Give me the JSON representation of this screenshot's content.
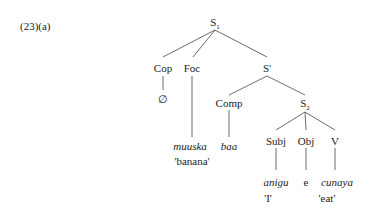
{
  "example_number": "(23)(a)",
  "tree": {
    "root": {
      "label": "S",
      "subscript": "1"
    },
    "cop": "Cop",
    "foc": "Foc",
    "sbar": "S'",
    "null_cop": "∅",
    "comp": "Comp",
    "s2": {
      "label": "S",
      "subscript": "2"
    },
    "subj": "Subj",
    "obj": "Obj",
    "v": "V",
    "foc_word": "muuska",
    "foc_gloss": "'banana'",
    "comp_word": "baa",
    "subj_word": "anigu",
    "subj_gloss": "'I'",
    "obj_word": "e",
    "v_word": "cunaya",
    "v_gloss": "'eat'"
  }
}
